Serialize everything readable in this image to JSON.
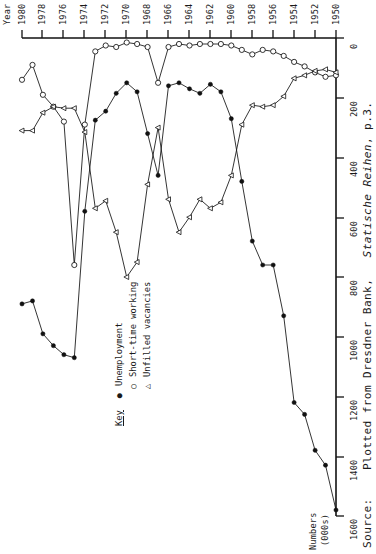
{
  "figure": {
    "value_axis": {
      "title_line1": "Numbers",
      "title_line2": "(000s)",
      "ticks": [
        "0",
        "200",
        "400",
        "600",
        "800",
        "1000",
        "1200",
        "1400",
        "1600"
      ]
    },
    "time_axis": {
      "title": "Year",
      "ticks": [
        "1950",
        "1952",
        "1954",
        "1956",
        "1958",
        "1960",
        "1962",
        "1964",
        "1966",
        "1968",
        "1970",
        "1972",
        "1974",
        "1976",
        "1978",
        "1980"
      ]
    },
    "legend": {
      "title": "Key",
      "items": [
        {
          "marker": "●",
          "label": "Unemployment"
        },
        {
          "marker": "○",
          "label": "Short-time working"
        },
        {
          "marker": "△",
          "label": "Unfilled vacancies"
        }
      ]
    },
    "source": {
      "prefix": "Source:",
      "text_before": "Plotted from Dresdner Bank,",
      "italic": "Statische Reihen",
      "text_after": ", p.3."
    }
  },
  "chart_data": {
    "type": "line",
    "title": "",
    "subtitle": "",
    "orientation": "rotated-90-ccw (years run up the page, values run right-to-left)",
    "xlabel": "Year",
    "ylabel": "Numbers (000s)",
    "xlim": [
      1950,
      1980
    ],
    "ylim": [
      0,
      1600
    ],
    "grid": false,
    "legend_position": "upper-left",
    "x": [
      1950,
      1951,
      1952,
      1953,
      1954,
      1955,
      1956,
      1957,
      1958,
      1959,
      1960,
      1961,
      1962,
      1963,
      1964,
      1965,
      1966,
      1967,
      1968,
      1969,
      1970,
      1971,
      1972,
      1973,
      1974,
      1975,
      1976,
      1977,
      1978,
      1979,
      1980
    ],
    "series": [
      {
        "name": "Unemployment",
        "marker": "filled-circle",
        "values": [
          1580,
          1430,
          1380,
          1260,
          1220,
          930,
          760,
          760,
          680,
          480,
          270,
          180,
          155,
          185,
          170,
          150,
          160,
          460,
          320,
          180,
          150,
          185,
          245,
          275,
          580,
          1070,
          1060,
          1030,
          990,
          880,
          890
        ]
      },
      {
        "name": "Short-time working",
        "marker": "open-circle",
        "values": [
          125,
          130,
          115,
          95,
          80,
          60,
          45,
          40,
          55,
          40,
          25,
          20,
          20,
          20,
          25,
          20,
          30,
          150,
          30,
          20,
          15,
          30,
          25,
          45,
          290,
          760,
          280,
          230,
          190,
          90,
          140
        ]
      },
      {
        "name": "Unfilled vacancies",
        "marker": "triangle",
        "values": [
          115,
          105,
          110,
          125,
          135,
          195,
          225,
          230,
          225,
          290,
          460,
          550,
          570,
          540,
          600,
          650,
          540,
          300,
          490,
          750,
          800,
          650,
          545,
          570,
          315,
          235,
          235,
          230,
          250,
          310,
          310
        ]
      }
    ]
  }
}
